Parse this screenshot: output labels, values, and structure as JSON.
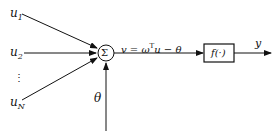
{
  "diagram": {
    "inputs": [
      {
        "base": "u",
        "sub": "1"
      },
      {
        "base": "u",
        "sub": "2"
      },
      {
        "base": "u",
        "sub": "N"
      }
    ],
    "ellipsis": "⋮",
    "sum_symbol": "Σ",
    "threshold": "θ",
    "equation": {
      "lhs": "v = ω",
      "sup": "T",
      "rhs": "u − θ"
    },
    "activation": "f(·)",
    "output": "y"
  }
}
